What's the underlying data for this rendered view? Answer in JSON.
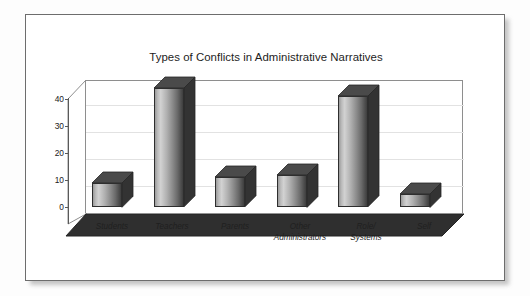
{
  "chart_data": {
    "type": "bar",
    "title": "Types of Conflicts in Administrative Narratives",
    "xlabel": "",
    "ylabel": "",
    "categories": [
      "Students",
      "Teachers",
      "Parents",
      "Other\nAdministrators",
      "Role/\nSystems",
      "Self"
    ],
    "values": [
      9,
      44,
      11,
      12,
      41,
      5
    ],
    "ytick_labels": [
      "0",
      "10",
      "20",
      "30",
      "40"
    ],
    "ytick_values": [
      0,
      10,
      20,
      30,
      40
    ],
    "ylim": [
      0,
      46
    ],
    "grid": true,
    "legend": false,
    "style": "3d-column",
    "bar_color": "#8c8c8c",
    "floor_color": "#2e2e2e",
    "axis_color": "#5a5a5a",
    "title_color": "#1d1d1d"
  },
  "axis": {
    "y0_label": "0",
    "y10_label": "10",
    "y20_label": "20",
    "y30_label": "30",
    "y40_label": "40"
  },
  "categories": {
    "c0": "Students",
    "c1": "Teachers",
    "c2": "Parents",
    "c3": "Other\nAdministrators",
    "c4": "Role/\nSystems",
    "c5": "Self"
  }
}
